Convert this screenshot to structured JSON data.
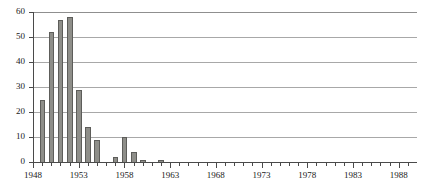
{
  "chart_data": {
    "type": "bar",
    "title": "",
    "subtitle": "",
    "xlabel": "",
    "ylabel": "",
    "ylim": [
      0,
      60
    ],
    "ytick_values": [
      0,
      10,
      20,
      30,
      40,
      50,
      60
    ],
    "ytick_labels": [
      "0",
      "10",
      "20",
      "30",
      "40",
      "50",
      "60"
    ],
    "xlim": [
      1948,
      1989
    ],
    "xtick_labels": [
      "1948",
      "1953",
      "1958",
      "1963",
      "1968",
      "1973",
      "1978",
      "1983",
      "1988"
    ],
    "xtick_values": [
      1948,
      1953,
      1958,
      1963,
      1968,
      1973,
      1978,
      1983,
      1988
    ],
    "grid": "horizontal",
    "legend": "none",
    "bar_color": "#8e8e89",
    "bar_edge_color": "#5d5d5a",
    "axis_color": "#4a4a4a",
    "gridline_color": "#a8a8a8",
    "categories": [
      1948,
      1949,
      1950,
      1951,
      1952,
      1953,
      1954,
      1955,
      1956,
      1957,
      1958,
      1959,
      1960,
      1961,
      1962,
      1963,
      1964,
      1965,
      1966,
      1967,
      1968,
      1969,
      1970,
      1971,
      1972,
      1973,
      1974,
      1975,
      1976,
      1977,
      1978,
      1979,
      1980,
      1981,
      1982,
      1983,
      1984,
      1985,
      1986,
      1987,
      1988,
      1989
    ],
    "values": [
      0,
      25,
      52,
      57,
      58,
      29,
      14,
      9,
      0,
      2,
      10,
      4,
      1,
      0,
      1,
      0,
      0,
      0,
      0,
      0,
      0,
      0,
      0,
      0,
      0,
      0,
      0,
      0,
      0,
      0,
      0,
      0,
      0,
      0,
      0,
      0,
      0,
      0,
      0,
      0,
      0,
      0
    ]
  }
}
